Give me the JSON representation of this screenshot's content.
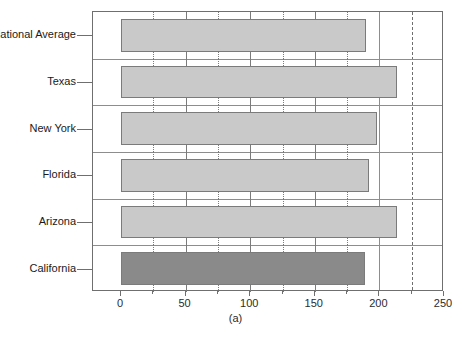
{
  "chart_data": {
    "type": "bar",
    "orientation": "horizontal",
    "title": "",
    "subtitle": "",
    "caption": "(a)",
    "xlabel": "",
    "ylabel": "",
    "categories": [
      "National Average",
      "Texas",
      "New York",
      "Florida",
      "Arizona",
      "California"
    ],
    "values": [
      190,
      214,
      198,
      192,
      214,
      189
    ],
    "series": [
      {
        "name": "value",
        "values": [
          190,
          214,
          198,
          192,
          214,
          189
        ]
      }
    ],
    "xlim": [
      0,
      250
    ],
    "xticks": [
      0,
      50,
      100,
      150,
      200,
      250
    ],
    "xtick_labels": [
      "0",
      "50",
      "100",
      "150",
      "200",
      "250"
    ],
    "xminor_ticks": [
      25,
      75,
      125,
      175,
      225
    ],
    "grid": true,
    "legend": "none",
    "annotations": [
      {
        "name": "reference-line-dashed",
        "value": 225,
        "style": "dashed",
        "color": "#6f6f6f"
      },
      {
        "name": "reference-line-solid",
        "value": 200,
        "style": "solid",
        "color": "#8d8d8d"
      }
    ],
    "bar_colors": {
      "default": "#c9c9c9",
      "highlight": "#8a8a8a",
      "edge": "#7b7b7b",
      "highlight_category": "California"
    },
    "axis_color": "#6f6f6f",
    "background": "#ffffff"
  }
}
